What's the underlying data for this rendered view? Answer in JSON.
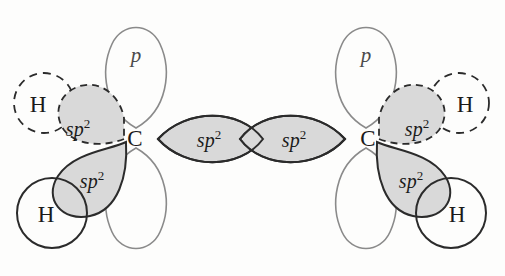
{
  "figure": {
    "background_color": "#fdfdfc",
    "stroke_dark": "#2b2b2b",
    "stroke_light": "#8a8a8a",
    "orbital_fill": "#d9d9d9"
  },
  "labels": {
    "carbon": "C",
    "hydrogen": "H",
    "p_orbital": "p",
    "sp_base": "sp",
    "sp_superscript": "2"
  },
  "atoms": [
    {
      "id": "carbon-left",
      "symbol": "C",
      "x": 135,
      "y": 137
    },
    {
      "id": "carbon-right",
      "symbol": "C",
      "x": 368,
      "y": 137
    },
    {
      "id": "hydrogen-left-back",
      "symbol": "H",
      "x": 40,
      "y": 103,
      "style": "dashed"
    },
    {
      "id": "hydrogen-left-front",
      "symbol": "H",
      "x": 46,
      "y": 213,
      "style": "solid"
    },
    {
      "id": "hydrogen-right-back",
      "symbol": "H",
      "x": 463,
      "y": 103,
      "style": "dashed"
    },
    {
      "id": "hydrogen-right-front",
      "symbol": "H",
      "x": 457,
      "y": 213,
      "style": "solid"
    }
  ],
  "orbitals": [
    {
      "id": "p-orbital-left-top",
      "label": "p",
      "x": 136,
      "y": 55,
      "style": "solid-light",
      "filled": false
    },
    {
      "id": "p-orbital-left-bottom",
      "label": "",
      "x": 136,
      "y": 220,
      "style": "solid-light",
      "filled": false
    },
    {
      "id": "p-orbital-right-top",
      "label": "p",
      "x": 366,
      "y": 55,
      "style": "solid-light",
      "filled": false
    },
    {
      "id": "p-orbital-right-bottom",
      "label": "",
      "x": 366,
      "y": 220,
      "style": "solid-light",
      "filled": false
    },
    {
      "id": "sp2-left-back",
      "label": "sp",
      "sup": "2",
      "x": 89,
      "y": 130,
      "style": "dashed",
      "filled": true
    },
    {
      "id": "sp2-left-front",
      "label": "sp",
      "sup": "2",
      "x": 94,
      "y": 181,
      "style": "solid",
      "filled": true
    },
    {
      "id": "sp2-left-bond",
      "label": "sp",
      "sup": "2",
      "x": 213,
      "y": 139,
      "style": "solid",
      "filled": true
    },
    {
      "id": "sp2-right-bond",
      "label": "sp",
      "sup": "2",
      "x": 290,
      "y": 139,
      "style": "solid",
      "filled": true
    },
    {
      "id": "sp2-right-back",
      "label": "sp",
      "sup": "2",
      "x": 414,
      "y": 130,
      "style": "dashed",
      "filled": true
    },
    {
      "id": "sp2-right-front",
      "label": "sp",
      "sup": "2",
      "x": 409,
      "y": 181,
      "style": "solid",
      "filled": true
    }
  ]
}
